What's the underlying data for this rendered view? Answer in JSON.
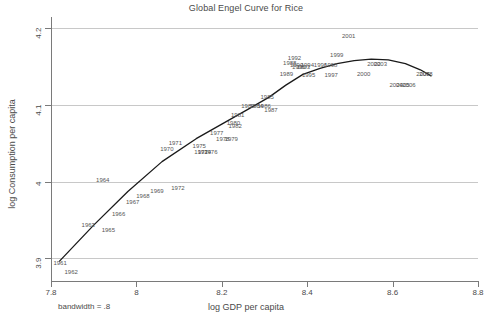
{
  "chart_data": {
    "type": "line",
    "title": "Global Engel Curve for Rice",
    "xlabel": "log GDP per capita",
    "ylabel": "log Consumption per capita",
    "xlim": [
      7.8,
      8.8
    ],
    "ylim": [
      3.87,
      4.215
    ],
    "xticks": [
      "7.8",
      "8",
      "8.2",
      "8.4",
      "8.6",
      "8.8"
    ],
    "xtick_values": [
      7.8,
      8.0,
      8.2,
      8.4,
      8.6,
      8.8
    ],
    "yticks": [
      "3.9",
      "4",
      "4.1",
      "4.2"
    ],
    "ytick_values": [
      3.9,
      4.0,
      4.1,
      4.2
    ],
    "grid": "horizontal",
    "legend": "none",
    "annotation": "bandwidth = .8",
    "series_name": "lowess smoothed Engel curve",
    "line_color": "#1a1a1a",
    "grid_color": "#c8c8c8",
    "point_labels": [
      {
        "label": "1961",
        "x": 7.822,
        "y": 3.893
      },
      {
        "label": "1962",
        "x": 7.848,
        "y": 3.882
      },
      {
        "label": "1963",
        "x": 7.888,
        "y": 3.943
      },
      {
        "label": "1964",
        "x": 7.922,
        "y": 4.002
      },
      {
        "label": "1965",
        "x": 7.935,
        "y": 3.937
      },
      {
        "label": "1966",
        "x": 7.959,
        "y": 3.957
      },
      {
        "label": "1967",
        "x": 7.992,
        "y": 3.973
      },
      {
        "label": "1968",
        "x": 8.016,
        "y": 3.981
      },
      {
        "label": "1969",
        "x": 8.049,
        "y": 3.987
      },
      {
        "label": "1970",
        "x": 8.072,
        "y": 4.043
      },
      {
        "label": "1971",
        "x": 8.092,
        "y": 4.05
      },
      {
        "label": "1972",
        "x": 8.098,
        "y": 3.991
      },
      {
        "label": "1975",
        "x": 8.148,
        "y": 4.047
      },
      {
        "label": "1973",
        "x": 8.152,
        "y": 4.039
      },
      {
        "label": "1974",
        "x": 8.16,
        "y": 4.038
      },
      {
        "label": "1976",
        "x": 8.175,
        "y": 4.038
      },
      {
        "label": "1977",
        "x": 8.189,
        "y": 4.064
      },
      {
        "label": "1978",
        "x": 8.203,
        "y": 4.055
      },
      {
        "label": "1979",
        "x": 8.223,
        "y": 4.055
      },
      {
        "label": "1980",
        "x": 8.228,
        "y": 4.076
      },
      {
        "label": "1982",
        "x": 8.232,
        "y": 4.072
      },
      {
        "label": "1981",
        "x": 8.238,
        "y": 4.087
      },
      {
        "label": "1983",
        "x": 8.262,
        "y": 4.099
      },
      {
        "label": "1984",
        "x": 8.282,
        "y": 4.099
      },
      {
        "label": "1986",
        "x": 8.3,
        "y": 4.099
      },
      {
        "label": "1985",
        "x": 8.307,
        "y": 4.11
      },
      {
        "label": "1987",
        "x": 8.316,
        "y": 4.094
      },
      {
        "label": "1989",
        "x": 8.352,
        "y": 4.141
      },
      {
        "label": "1988",
        "x": 8.36,
        "y": 4.155
      },
      {
        "label": "1992",
        "x": 8.371,
        "y": 4.162
      },
      {
        "label": "1990",
        "x": 8.376,
        "y": 4.152
      },
      {
        "label": "1991",
        "x": 8.381,
        "y": 4.15
      },
      {
        "label": "1993",
        "x": 8.392,
        "y": 4.15
      },
      {
        "label": "1994",
        "x": 8.401,
        "y": 4.152
      },
      {
        "label": "1995",
        "x": 8.404,
        "y": 4.139
      },
      {
        "label": "1996",
        "x": 8.432,
        "y": 4.152
      },
      {
        "label": "1998",
        "x": 8.456,
        "y": 4.152
      },
      {
        "label": "1997",
        "x": 8.457,
        "y": 4.139
      },
      {
        "label": "1999",
        "x": 8.47,
        "y": 4.165
      },
      {
        "label": "2001",
        "x": 8.498,
        "y": 4.19
      },
      {
        "label": "2000",
        "x": 8.533,
        "y": 4.14
      },
      {
        "label": "2002",
        "x": 8.557,
        "y": 4.154
      },
      {
        "label": "2003",
        "x": 8.572,
        "y": 4.154
      },
      {
        "label": "2004",
        "x": 8.609,
        "y": 4.126
      },
      {
        "label": "2005",
        "x": 8.625,
        "y": 4.126
      },
      {
        "label": "2006",
        "x": 8.639,
        "y": 4.126
      },
      {
        "label": "2007",
        "x": 8.672,
        "y": 4.141
      },
      {
        "label": "2008",
        "x": 8.679,
        "y": 4.141
      }
    ],
    "curve_points": [
      {
        "x": 7.82,
        "y": 3.896
      },
      {
        "x": 7.9,
        "y": 3.943
      },
      {
        "x": 7.98,
        "y": 3.987
      },
      {
        "x": 8.06,
        "y": 4.026
      },
      {
        "x": 8.14,
        "y": 4.056
      },
      {
        "x": 8.2,
        "y": 4.075
      },
      {
        "x": 8.26,
        "y": 4.094
      },
      {
        "x": 8.31,
        "y": 4.11
      },
      {
        "x": 8.35,
        "y": 4.126
      },
      {
        "x": 8.39,
        "y": 4.14
      },
      {
        "x": 8.43,
        "y": 4.148
      },
      {
        "x": 8.47,
        "y": 4.154
      },
      {
        "x": 8.51,
        "y": 4.158
      },
      {
        "x": 8.55,
        "y": 4.16
      },
      {
        "x": 8.59,
        "y": 4.159
      },
      {
        "x": 8.63,
        "y": 4.154
      },
      {
        "x": 8.665,
        "y": 4.146
      },
      {
        "x": 8.69,
        "y": 4.138
      }
    ]
  }
}
